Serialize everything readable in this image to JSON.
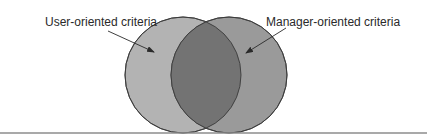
{
  "diagram": {
    "type": "venn",
    "sets": [
      {
        "label": "User-oriented criteria",
        "fill": "#b3b3b3"
      },
      {
        "label": "Manager-oriented criteria",
        "fill": "#9a9a9a"
      }
    ],
    "intersection_fill": "#737373",
    "outline_color": "#3a3a3a",
    "rule_color": "#8c8c8c"
  }
}
